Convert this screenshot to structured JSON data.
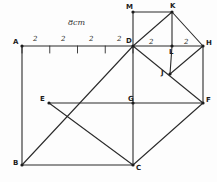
{
  "figure": {
    "title_note": "8cm",
    "stroke_color": "#2b2b2b",
    "background_color": "#fdfdfd",
    "vertices": [
      {
        "name": "A",
        "label": "A",
        "x": 22,
        "y": 46,
        "lx": 13,
        "ly": 39
      },
      {
        "name": "B",
        "label": "B",
        "x": 22,
        "y": 165,
        "lx": 13,
        "ly": 160
      },
      {
        "name": "C",
        "label": "C",
        "x": 133,
        "y": 165,
        "lx": 136,
        "ly": 165
      },
      {
        "name": "D",
        "label": "D",
        "x": 133,
        "y": 46,
        "lx": 126,
        "ly": 38
      },
      {
        "name": "E",
        "label": "E",
        "x": 49,
        "y": 103,
        "lx": 40,
        "ly": 96
      },
      {
        "name": "F",
        "label": "F",
        "x": 203,
        "y": 103,
        "lx": 206,
        "ly": 97
      },
      {
        "name": "G",
        "label": "G",
        "x": 133,
        "y": 103,
        "lx": 128,
        "ly": 96
      },
      {
        "name": "H",
        "label": "H",
        "x": 203,
        "y": 46,
        "lx": 206,
        "ly": 40
      },
      {
        "name": "J",
        "label": "J",
        "x": 170,
        "y": 74,
        "lx": 161,
        "ly": 70
      },
      {
        "name": "K",
        "label": "K",
        "x": 172,
        "y": 12,
        "lx": 170,
        "ly": 3
      },
      {
        "name": "L",
        "label": "L",
        "x": 172,
        "y": 46,
        "lx": 169,
        "ly": 49
      },
      {
        "name": "M",
        "label": "M",
        "x": 133,
        "y": 12,
        "lx": 126,
        "ly": 4
      }
    ],
    "edges": [
      {
        "name": "edge-A-D",
        "from": "A",
        "to": "D"
      },
      {
        "name": "edge-A-B",
        "from": "A",
        "to": "B"
      },
      {
        "name": "edge-B-C",
        "from": "B",
        "to": "C"
      },
      {
        "name": "edge-B-D",
        "from": "B",
        "to": "D"
      },
      {
        "name": "edge-D-C",
        "from": "D",
        "to": "C"
      },
      {
        "name": "edge-D-H",
        "from": "D",
        "to": "H"
      },
      {
        "name": "edge-E-F",
        "from": "E",
        "to": "F"
      },
      {
        "name": "edge-E-C",
        "from": "E",
        "to": "C"
      },
      {
        "name": "edge-C-F",
        "from": "C",
        "to": "F"
      },
      {
        "name": "edge-H-F",
        "from": "H",
        "to": "F"
      },
      {
        "name": "edge-D-F",
        "from": "D",
        "to": "F"
      },
      {
        "name": "edge-D-M",
        "from": "D",
        "to": "M"
      },
      {
        "name": "edge-M-K",
        "from": "M",
        "to": "K"
      },
      {
        "name": "edge-D-K",
        "from": "D",
        "to": "K"
      },
      {
        "name": "edge-K-L",
        "from": "K",
        "to": "L"
      },
      {
        "name": "edge-K-H",
        "from": "K",
        "to": "H"
      },
      {
        "name": "edge-L-J",
        "from": "L",
        "to": "J"
      },
      {
        "name": "edge-J-H",
        "from": "J",
        "to": "H"
      }
    ],
    "ruler": {
      "name": "scale-ruler",
      "y": 46,
      "tick_height": 7,
      "x_start": 22,
      "x_end": 133,
      "ticks": [
        22,
        49.75,
        77.5,
        105.25,
        133
      ],
      "segment_labels": [
        {
          "text": "2",
          "x": 33,
          "y": 36
        },
        {
          "text": "2",
          "x": 61,
          "y": 36
        },
        {
          "text": "2",
          "x": 89,
          "y": 36
        },
        {
          "text": "2",
          "x": 117,
          "y": 36
        }
      ],
      "total_label": {
        "text": "8cm",
        "x": 68,
        "y": 19
      }
    },
    "top_segment_labels": [
      {
        "name": "seg-label-DL",
        "text": "2",
        "x": 149,
        "y": 39
      },
      {
        "name": "seg-label-LH",
        "text": "2",
        "x": 184,
        "y": 39
      }
    ]
  }
}
